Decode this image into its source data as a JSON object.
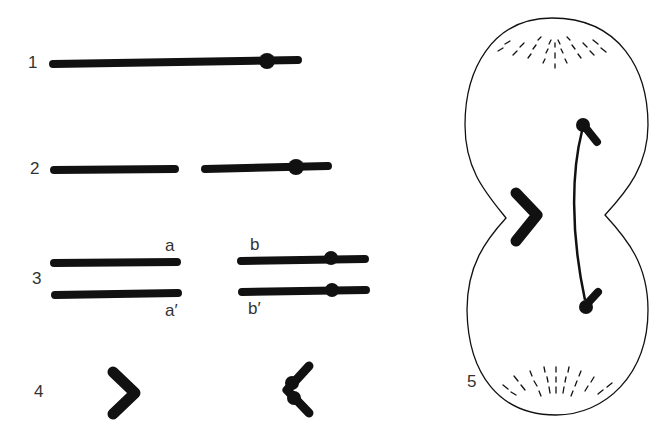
{
  "figure": {
    "panels": [
      {
        "id": "1",
        "label": "1",
        "description": "Single chromosome with centromere"
      },
      {
        "id": "2",
        "label": "2",
        "description": "Chromosome broken into acentric fragment and centric fragment"
      },
      {
        "id": "3",
        "label": "3",
        "description": "Replicated fragments",
        "sublabels": [
          "a",
          "a′",
          "b",
          "b′"
        ]
      },
      {
        "id": "4",
        "label": "4",
        "description": "Acentric fragment and fused dicentric chromatid"
      },
      {
        "id": "5",
        "label": "5",
        "description": "Anaphase cell with lagging acentric fragment and dicentric bridge"
      }
    ],
    "colors": {
      "ink": "#111111",
      "label": "#333333",
      "background": "#ffffff"
    }
  }
}
